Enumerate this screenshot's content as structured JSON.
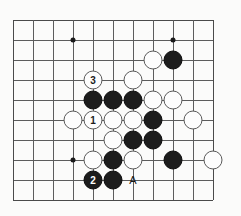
{
  "figure": {
    "kind": "go-board-diagram",
    "caption": "",
    "colors": {
      "black_stone": "#1c1c1c",
      "white_stone": "#fdfdfd",
      "grid": "#5c5c5c",
      "background": "#fbfbfa"
    }
  },
  "board": {
    "columns": 11,
    "rows": 10,
    "origin_x": 13,
    "origin_y": 20,
    "spacing": 20,
    "star_points": [
      {
        "col": 3,
        "row": 1
      },
      {
        "col": 8,
        "row": 1
      },
      {
        "col": 3,
        "row": 7
      },
      {
        "col": 8,
        "row": 7
      }
    ]
  },
  "stones": [
    {
      "col": 7,
      "row": 2,
      "color": "white",
      "move": ""
    },
    {
      "col": 8,
      "row": 2,
      "color": "black",
      "move": ""
    },
    {
      "col": 4,
      "row": 3,
      "color": "white",
      "move": "3"
    },
    {
      "col": 6,
      "row": 3,
      "color": "white",
      "move": ""
    },
    {
      "col": 4,
      "row": 4,
      "color": "black",
      "move": ""
    },
    {
      "col": 5,
      "row": 4,
      "color": "black",
      "move": ""
    },
    {
      "col": 6,
      "row": 4,
      "color": "black",
      "move": ""
    },
    {
      "col": 7,
      "row": 4,
      "color": "white",
      "move": ""
    },
    {
      "col": 8,
      "row": 4,
      "color": "white",
      "move": ""
    },
    {
      "col": 3,
      "row": 5,
      "color": "white",
      "move": ""
    },
    {
      "col": 4,
      "row": 5,
      "color": "white",
      "move": "1"
    },
    {
      "col": 5,
      "row": 5,
      "color": "white",
      "move": ""
    },
    {
      "col": 6,
      "row": 5,
      "color": "white",
      "move": ""
    },
    {
      "col": 7,
      "row": 5,
      "color": "black",
      "move": ""
    },
    {
      "col": 9,
      "row": 5,
      "color": "white",
      "move": ""
    },
    {
      "col": 5,
      "row": 6,
      "color": "white",
      "move": ""
    },
    {
      "col": 6,
      "row": 6,
      "color": "black",
      "move": ""
    },
    {
      "col": 7,
      "row": 6,
      "color": "black",
      "move": ""
    },
    {
      "col": 4,
      "row": 7,
      "color": "white",
      "move": ""
    },
    {
      "col": 5,
      "row": 7,
      "color": "black",
      "move": ""
    },
    {
      "col": 6,
      "row": 7,
      "color": "white",
      "move": ""
    },
    {
      "col": 8,
      "row": 7,
      "color": "black",
      "move": ""
    },
    {
      "col": 10,
      "row": 7,
      "color": "white",
      "move": ""
    },
    {
      "col": 4,
      "row": 8,
      "color": "black",
      "move": "2"
    },
    {
      "col": 5,
      "row": 8,
      "color": "black",
      "move": ""
    }
  ],
  "labels": [
    {
      "col": 6,
      "row": 8,
      "text": "A"
    }
  ]
}
